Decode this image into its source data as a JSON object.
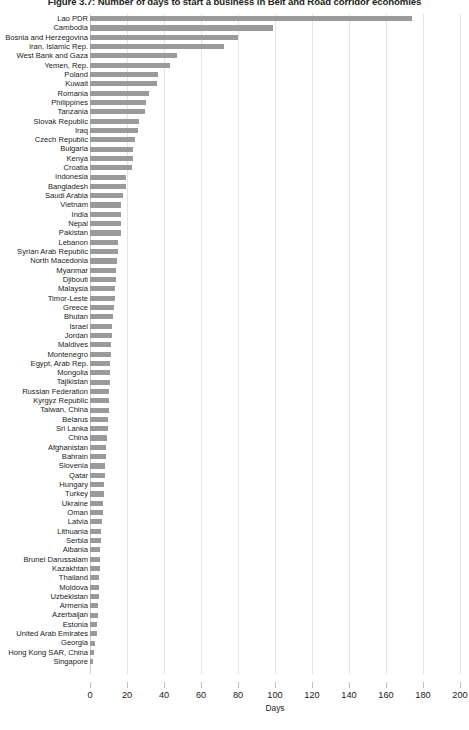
{
  "chart_data": {
    "type": "bar",
    "orientation": "horizontal",
    "title": "Figure 3.7: Number of days to start a business in Belt and Road corridor economies",
    "xlabel": "Days",
    "ylabel": "",
    "xlim": [
      0,
      200
    ],
    "xticks": [
      0,
      20,
      40,
      60,
      80,
      100,
      120,
      140,
      160,
      180,
      200
    ],
    "grid": true,
    "legend": false,
    "bar_color": "#9a9a9a",
    "categories": [
      "Lao PDR",
      "Cambodia",
      "Bosnia and Herzegovina",
      "Iran, Islamic Rep.",
      "West Bank and Gaza",
      "Yemen, Rep.",
      "Poland",
      "Kuwait",
      "Romania",
      "Philippines",
      "Tanzania",
      "Slovak Republic",
      "Iraq",
      "Czech Republic",
      "Bulgaria",
      "Kenya",
      "Croatia",
      "Indonesia",
      "Bangladesh",
      "Saudi Arabia",
      "Vietnam",
      "India",
      "Nepal",
      "Pakistan",
      "Lebanon",
      "Syrian Arab Republic",
      "North Macedonia",
      "Myanmar",
      "Djibouti",
      "Malaysia",
      "Timor-Leste",
      "Greece",
      "Bhutan",
      "Israel",
      "Jordan",
      "Maldives",
      "Montenegro",
      "Egypt, Arab Rep.",
      "Mongolia",
      "Tajikistan",
      "Russian Federation",
      "Kyrgyz Republic",
      "Taiwan, China",
      "Belarus",
      "Sri Lanka",
      "China",
      "Afghanistan",
      "Bahrain",
      "Slovenia",
      "Qatar",
      "Hungary",
      "Turkey",
      "Ukraine",
      "Oman",
      "Latvia",
      "Lithuania",
      "Serbia",
      "Albania",
      "Brunei Darussalam",
      "Kazakhtan",
      "Thailand",
      "Moldova",
      "Uzbekistan",
      "Armenia",
      "Azerbaijan",
      "Estonia",
      "United Arab Emirates",
      "Georgia",
      "Hong Kong SAR, China",
      "Singapore"
    ],
    "values": [
      174,
      99,
      80,
      72.5,
      47,
      43,
      37,
      36,
      32,
      30,
      29.5,
      26.5,
      26,
      24.5,
      23,
      23,
      22.5,
      19.6,
      19.5,
      18,
      17,
      17,
      16.5,
      16.5,
      15,
      15,
      14.5,
      14,
      14,
      13.5,
      13.5,
      13,
      12.5,
      12,
      12,
      11.5,
      11.5,
      11,
      11,
      11,
      10.5,
      10,
      10,
      9.5,
      9.5,
      9,
      8.8,
      8.5,
      8,
      8,
      7.5,
      7.5,
      7,
      6.8,
      6.5,
      6,
      5.8,
      5.5,
      5.5,
      5.2,
      5,
      5,
      4.8,
      4.5,
      4.2,
      4,
      3.8,
      2.8,
      2,
      1.5
    ]
  }
}
